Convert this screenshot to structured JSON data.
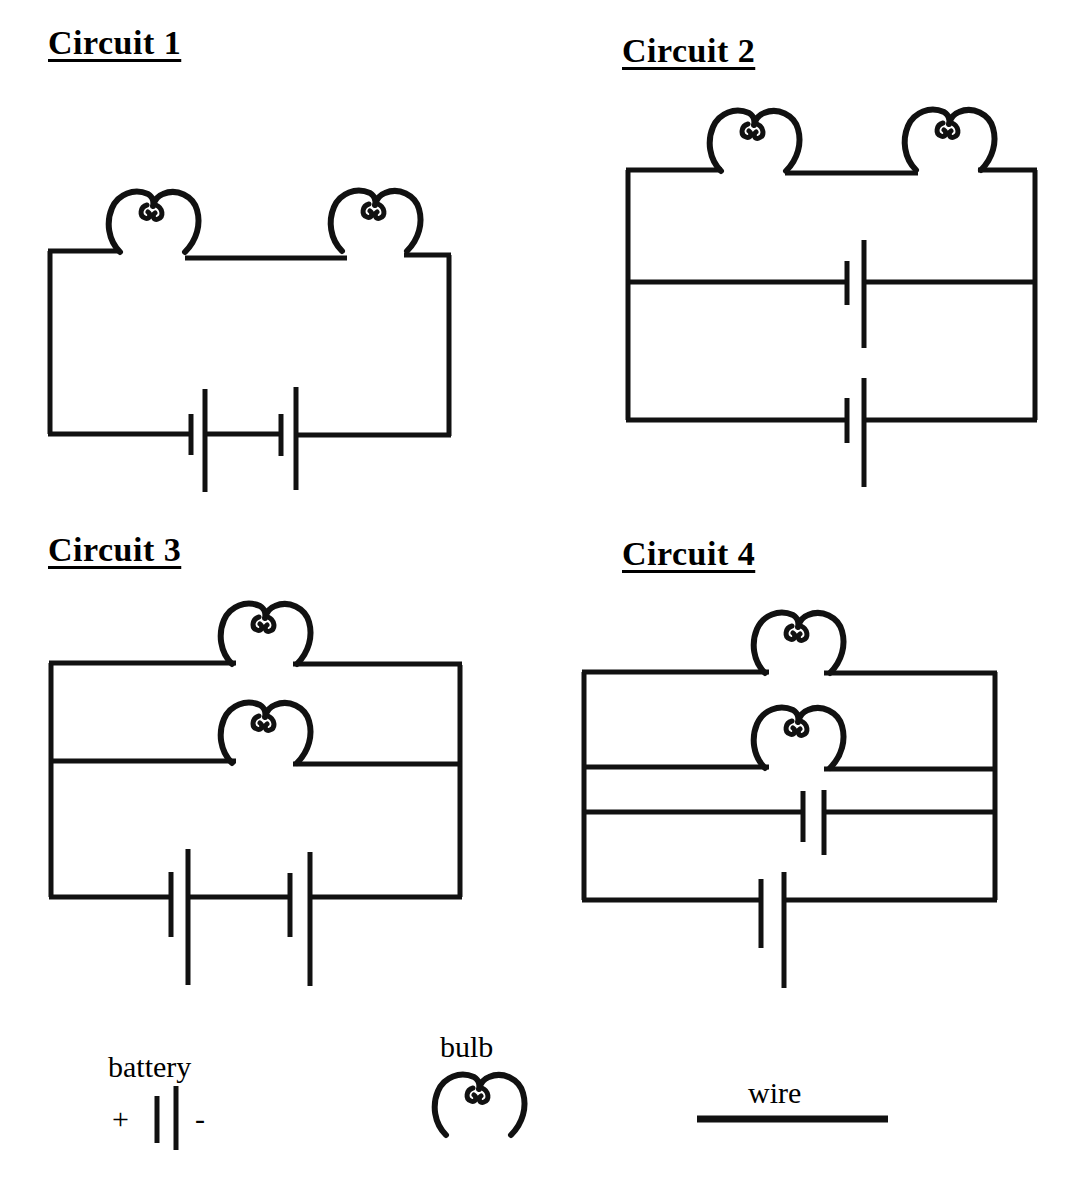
{
  "page": {
    "background_color": "#ffffff",
    "ink_color": "#111111",
    "width": 1073,
    "height": 1195
  },
  "circuits": [
    {
      "id": "circuit-1",
      "title": "Circuit 1",
      "bulbs": 2,
      "batteries": 2,
      "bulb_arrangement": "series",
      "battery_arrangement": "series",
      "description": "Two bulbs in series on the top wire with two battery cells in series along the bottom wire of a single loop."
    },
    {
      "id": "circuit-2",
      "title": "Circuit 2",
      "bulbs": 2,
      "batteries": 2,
      "bulb_arrangement": "series",
      "battery_arrangement": "parallel",
      "description": "Two bulbs in series on the top wire; two battery cells on separate parallel branches."
    },
    {
      "id": "circuit-3",
      "title": "Circuit 3",
      "bulbs": 2,
      "batteries": 2,
      "bulb_arrangement": "parallel",
      "battery_arrangement": "series",
      "description": "Two bulbs on separate parallel branches; two battery cells in series along the bottom wire."
    },
    {
      "id": "circuit-4",
      "title": "Circuit 4",
      "bulbs": 2,
      "batteries": 2,
      "bulb_arrangement": "parallel",
      "battery_arrangement": "parallel",
      "description": "Two bulbs on separate parallel branches; two battery cells on separate parallel branches."
    }
  ],
  "legend": {
    "battery": {
      "label": "battery",
      "plus_sign": "+",
      "minus_sign": "-"
    },
    "bulb": {
      "label": "bulb"
    },
    "wire": {
      "label": "wire"
    }
  }
}
